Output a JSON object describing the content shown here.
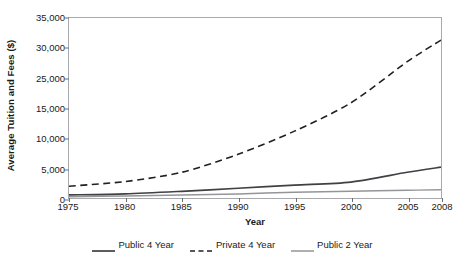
{
  "chart_data": {
    "type": "line",
    "title": "",
    "xlabel": "Year",
    "ylabel": "Average Tuition and Fees ($)",
    "xlim": [
      1975,
      2008
    ],
    "ylim": [
      0,
      35000
    ],
    "grid": false,
    "legend_position": "bottom",
    "x_tick_labels": [
      "1975",
      "1980",
      "1985",
      "1990",
      "1995",
      "2000",
      "2005",
      "2008"
    ],
    "x_ticks": [
      1975,
      1980,
      1985,
      1990,
      1995,
      2000,
      2005,
      2008
    ],
    "y_tick_labels": [
      "35,000",
      "30,000",
      "25,000",
      "15,000",
      "10,000",
      "5,000",
      "0"
    ],
    "y_ticks": [
      35000,
      30000,
      25000,
      20000,
      10000,
      5000,
      0
    ],
    "x": [
      1975,
      1980,
      1985,
      1990,
      1995,
      2000,
      2005,
      2008
    ],
    "series": [
      {
        "name": "Public 4 Year",
        "style": "solid",
        "color": "#414042",
        "width": 1.7,
        "values": [
          600,
          800,
          1300,
          1900,
          2500,
          3100,
          5000,
          6000
        ]
      },
      {
        "name": "Private 4 Year",
        "style": "dashed",
        "color": "#231f20",
        "width": 1.6,
        "values": [
          2300,
          3200,
          5000,
          8500,
          13000,
          18500,
          26500,
          30700
        ]
      },
      {
        "name": "Public 2 Year",
        "style": "solid",
        "color": "#939598",
        "width": 1.5,
        "values": [
          250,
          400,
          600,
          800,
          1100,
          1300,
          1500,
          1600
        ]
      }
    ]
  },
  "legend": {
    "items": [
      {
        "label": "Public 4 Year",
        "swatch": "solid-dark-line-icon"
      },
      {
        "label": "Private 4 Year",
        "swatch": "dashed-line-icon"
      },
      {
        "label": "Public 2 Year",
        "swatch": "solid-gray-line-icon"
      }
    ]
  },
  "colors": {
    "frame": "#a7a9ac",
    "text": "#1a1a1a",
    "public4": "#414042",
    "private4": "#231f20",
    "public2": "#939598"
  }
}
